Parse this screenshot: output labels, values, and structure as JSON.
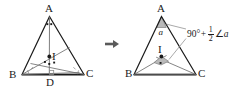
{
  "figure": {
    "type": "geometry-diagram",
    "colors": {
      "stroke": "#1b1b1b",
      "light_stroke": "#8c8c8c",
      "baseline": "#9a9a9a",
      "shade_fill": "#b9b9b9",
      "text": "#1b1b1b",
      "arrow": "#5a5a5a"
    }
  },
  "left_figure": {
    "name": "triangle-abc-with-incenter",
    "vertex_a": "A",
    "vertex_b": "B",
    "vertex_c": "C",
    "incenter": "I",
    "foot": "D",
    "marks": {
      "a_bisector_ticks": 2,
      "b_bisector_ticks": 1,
      "c_bisector_ticks": 1,
      "right_angle_at_d": true
    }
  },
  "arrow": {
    "name": "transform-arrow",
    "glyph": "right-arrow-icon",
    "direction": "right"
  },
  "right_figure": {
    "name": "triangle-abc-angle-result",
    "vertex_a": "A",
    "vertex_b": "B",
    "vertex_c": "C",
    "incenter": "I",
    "angle_at_a_label": "a",
    "formula": {
      "lead": "90°",
      "plus": "+",
      "fraction_numerator": "1",
      "fraction_denominator": "2",
      "angle_symbol": "∠",
      "angle_name": "a",
      "full_text": "90° + 1/2 ∠a"
    }
  }
}
